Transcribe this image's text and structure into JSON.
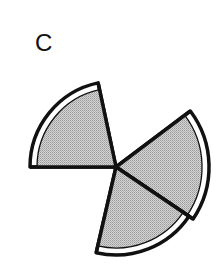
{
  "panel_label": "C",
  "diagram": {
    "type": "sector-fan",
    "center": [
      116,
      167
    ],
    "fill_color": "#c8c8c8",
    "stroke_color": "#111111",
    "band_color": "#ffffff",
    "sectors": [
      {
        "name": "upper-left",
        "start_deg": 102,
        "end_deg": 180,
        "radius": 86,
        "band": 7
      },
      {
        "name": "right",
        "start_deg": -34,
        "end_deg": 37,
        "radius": 93,
        "band": 7
      },
      {
        "name": "lower",
        "start_deg": -103,
        "end_deg": -34,
        "radius": 88,
        "band": 7
      }
    ]
  }
}
